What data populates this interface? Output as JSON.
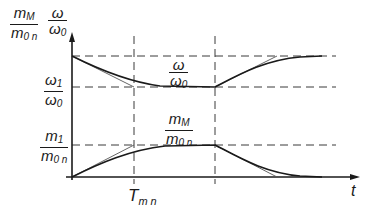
{
  "figure": {
    "type": "diagram",
    "colors": {
      "line": "#1a1a1a",
      "dashed": "#3a3a3a",
      "tangent": "#555555",
      "background": "#ffffff"
    }
  },
  "axes": {
    "x_label": "t",
    "y_label_torque": {
      "num": "m",
      "num_sub": "M",
      "den": "m",
      "den_sub": "0 n"
    },
    "y_label_speed": {
      "num": "ω",
      "num_sub": "",
      "den": "ω",
      "den_sub": "0"
    }
  },
  "levels": {
    "omega1": {
      "num": "ω",
      "num_sub": "1",
      "den": "ω",
      "den_sub": "0"
    },
    "m1": {
      "num": "m",
      "num_sub": "1",
      "den": "m",
      "den_sub": "0 n"
    }
  },
  "curve_labels": {
    "speed": {
      "num": "ω",
      "num_sub": "",
      "den": "ω",
      "den_sub": "0"
    },
    "torque": {
      "num": "m",
      "num_sub": "M",
      "den": "m",
      "den_sub": "0 n"
    }
  },
  "time_marks": {
    "T": {
      "main": "T",
      "sub": "m n"
    }
  }
}
